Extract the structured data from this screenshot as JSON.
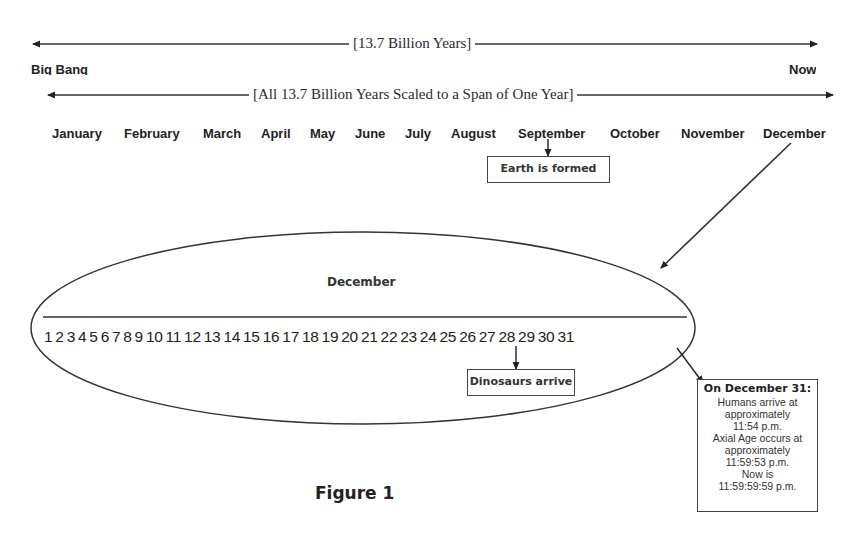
{
  "timeline": {
    "span_label": "[13.7 Billion Years]",
    "start_label": "Big Bang",
    "end_label": "Now",
    "scaled_label": "[All 13.7 Billion Years Scaled to a Span of One Year]"
  },
  "months": [
    {
      "label": "January"
    },
    {
      "label": "February"
    },
    {
      "label": "March"
    },
    {
      "label": "April"
    },
    {
      "label": "May"
    },
    {
      "label": "June"
    },
    {
      "label": "July"
    },
    {
      "label": "August"
    },
    {
      "label": "September"
    },
    {
      "label": "October"
    },
    {
      "label": "November"
    },
    {
      "label": "December"
    }
  ],
  "callouts": {
    "earth": "Earth is formed",
    "dinosaurs": "Dinosaurs arrive"
  },
  "december": {
    "title": "December",
    "days": "1 2 3 4 5 6 7 8 9 10 11 12 13 14 15 16 17 18 19 20 21 22 23 24 25 26 27 28 29 30 31"
  },
  "dec31_box": {
    "heading": "On December 31:",
    "lines": [
      "Humans arrive at",
      "approximately",
      "11:54 p.m.",
      "Axial Age occurs at",
      "approximately",
      "11:59:53 p.m.",
      "Now is",
      "11:59:59:59 p.m."
    ]
  },
  "caption": "Figure 1",
  "colors": {
    "ink": "#1a1a1a",
    "background": "#ffffff"
  }
}
